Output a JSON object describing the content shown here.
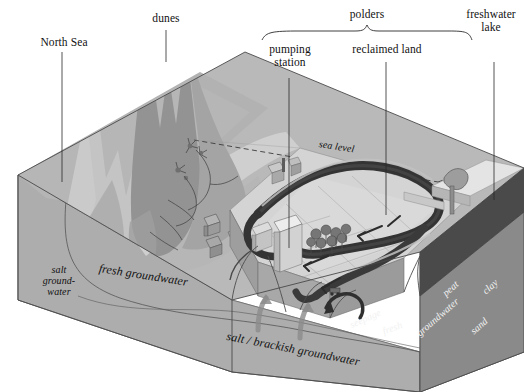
{
  "figure": {
    "type": "block-diagram",
    "background_color": "#ffffff"
  },
  "top_labels": {
    "north_sea": "North Sea",
    "dunes": "dunes",
    "polders": "polders",
    "pumping_station": "pumping\nstation",
    "reclaimed_land": "reclaimed land",
    "freshwater_lake": "freshwater\nlake"
  },
  "inline_labels": {
    "sea_level": "sea level",
    "fresh_groundwater": "fresh groundwater",
    "salt_groundwater": "salt\nground-\nwater",
    "salt_brackish_groundwater": "salt / brackish groundwater",
    "seepage": "seepage",
    "fresh": "fresh",
    "groundwater": "groundwater",
    "peat": "peat",
    "clay": "clay",
    "sand": "sand"
  },
  "palette": {
    "page_bg": "#ffffff",
    "sea_surface": "#b4b4b4",
    "beach": "#c9c9c9",
    "dune_dark": "#8e8e8e",
    "dune_mid": "#a6a6a6",
    "dune_light": "#c0c0c0",
    "front_face": "#ababab",
    "left_face": "#a3a3a3",
    "right_face_upper": "#9a9a9a",
    "clay_layer": "#4e4e4e",
    "sand_layer": "#8a8a8a",
    "polder_land": "#d2d2d2",
    "canal_water": "#3a3a3a",
    "lake_water": "#dedede",
    "dike": "#bdbdbd",
    "building": "#e3e3e3",
    "line_ink": "#1a1a1a",
    "label_white": "#f2f2f2"
  },
  "leader_lines": [
    {
      "name": "north-sea-leader",
      "x1": 62,
      "y1": 52,
      "x2": 62,
      "y2": 182
    },
    {
      "name": "dunes-leader",
      "x1": 166,
      "y1": 30,
      "x2": 166,
      "y2": 62
    },
    {
      "name": "pumping-station-leader",
      "x1": 289,
      "y1": 78,
      "x2": 289,
      "y2": 248
    },
    {
      "name": "reclaimed-land-leader",
      "x1": 386,
      "y1": 62,
      "x2": 386,
      "y2": 215
    },
    {
      "name": "freshwater-lake-leader",
      "x1": 494,
      "y1": 62,
      "x2": 494,
      "y2": 200
    }
  ],
  "brace": {
    "name": "polders-brace",
    "left_x": 262,
    "right_x": 472,
    "center_x": 367,
    "y": 40
  }
}
